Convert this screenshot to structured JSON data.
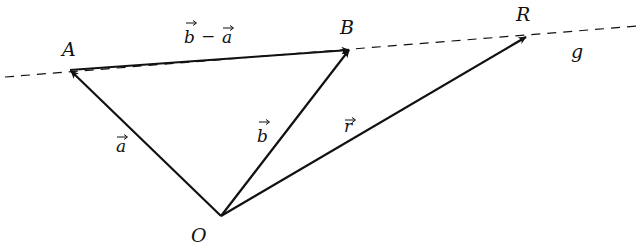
{
  "diagram": {
    "points": {
      "O": {
        "label": "O",
        "x": 221,
        "y": 216
      },
      "A": {
        "label": "A",
        "x": 70,
        "y": 70
      },
      "B": {
        "label": "B",
        "x": 350,
        "y": 49
      },
      "R": {
        "label": "R",
        "x": 527,
        "y": 36
      }
    },
    "line": {
      "label": "g",
      "from": {
        "x": 5,
        "y": 77
      },
      "to": {
        "x": 638,
        "y": 26
      }
    },
    "vectors": [
      {
        "name": "a",
        "label": "a",
        "from": "O",
        "to": "A"
      },
      {
        "name": "b",
        "label": "b",
        "from": "O",
        "to": "B"
      },
      {
        "name": "r",
        "label": "r",
        "from": "O",
        "to": "R"
      },
      {
        "name": "b-minus-a",
        "label_left": "b",
        "operator": "−",
        "label_right": "a",
        "from": "A",
        "to": "B"
      }
    ],
    "colors": {
      "stroke": "#111111",
      "background": "#ffffff"
    }
  }
}
